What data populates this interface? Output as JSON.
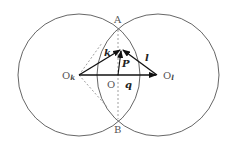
{
  "diagram": {
    "title": "",
    "circles": [
      {
        "name": "circle-k",
        "cx": 79,
        "cy": 75,
        "r": 61
      },
      {
        "name": "circle-l",
        "cx": 158,
        "cy": 75,
        "r": 61
      }
    ],
    "points": {
      "A": {
        "label": "A",
        "x": 118,
        "y": 30
      },
      "B": {
        "label": "B",
        "x": 118,
        "y": 119
      },
      "O": {
        "label": "O",
        "x": 118,
        "y": 75
      },
      "Ok": {
        "label": "O",
        "sub": "k",
        "x": 79,
        "y": 75
      },
      "Ol": {
        "label": "O",
        "sub": "l",
        "x": 158,
        "y": 75
      },
      "P_tip": {
        "x": 121,
        "y": 49
      }
    },
    "vectors": {
      "k": {
        "label": "k",
        "from": "Ok",
        "to": "P_tip"
      },
      "l": {
        "label": "l",
        "from": "Ol",
        "to": "P_tip"
      },
      "P": {
        "label": "P",
        "from": "O",
        "to": "P_tip"
      },
      "q": {
        "label": "q",
        "from": "Ok",
        "to": "Ol"
      }
    },
    "colors": {
      "circle": "#555555",
      "arrow": "#111111",
      "dashed": "#888888",
      "label": "#555555"
    }
  }
}
